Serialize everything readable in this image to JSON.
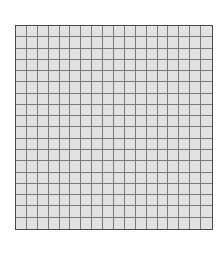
{
  "grid": {
    "rows": 18,
    "columns": 18,
    "colors": {
      "cell_fill": "#e2e2e2",
      "grid_line": "#7a7a7a",
      "border": "#4a4a4a",
      "background": "#ffffff"
    }
  }
}
